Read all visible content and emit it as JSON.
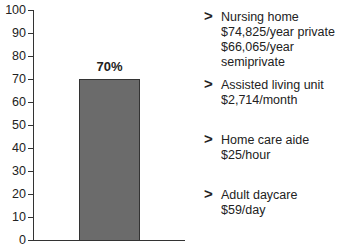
{
  "chart_data": {
    "type": "bar",
    "title": "",
    "xlabel": "",
    "ylabel": "",
    "ylim": [
      0,
      100
    ],
    "yticks": [
      0,
      10,
      20,
      30,
      40,
      50,
      60,
      70,
      80,
      90,
      100
    ],
    "categories": [
      ""
    ],
    "values": [
      70
    ],
    "data_labels": [
      "70%"
    ],
    "grid": false,
    "bar_color": "#6b6b6b",
    "annotations": [
      {
        "heading": "Nursing home",
        "lines": [
          "$74,825/year private",
          "$66,065/year semiprivate"
        ]
      },
      {
        "heading": "Assisted living unit",
        "lines": [
          "$2,714/month"
        ]
      },
      {
        "heading": "Home care aide",
        "lines": [
          "$25/hour"
        ]
      },
      {
        "heading": "Adult daycare",
        "lines": [
          "$59/day"
        ]
      }
    ]
  },
  "axis": {
    "ticks": [
      "0",
      "10",
      "20",
      "30",
      "40",
      "50",
      "60",
      "70",
      "80",
      "90",
      "100"
    ]
  },
  "bar": {
    "label": "70%",
    "value": 70
  },
  "legend": {
    "arrow": ">",
    "items": [
      {
        "heading": "Nursing home",
        "line1": "$74,825/year private",
        "line2": "$66,065/year semiprivate"
      },
      {
        "heading": "Assisted living unit",
        "line1": "$2,714/month"
      },
      {
        "heading": "Home care aide",
        "line1": "$25/hour"
      },
      {
        "heading": "Adult daycare",
        "line1": "$59/day"
      }
    ]
  }
}
